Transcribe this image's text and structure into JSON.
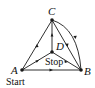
{
  "diagram": {
    "type": "directed-graph",
    "nodes": [
      {
        "id": "A",
        "label": "A",
        "x": 22,
        "y": 70
      },
      {
        "id": "B",
        "label": "B",
        "x": 81,
        "y": 70
      },
      {
        "id": "C",
        "label": "C",
        "x": 52,
        "y": 20
      },
      {
        "id": "D",
        "label": "D",
        "x": 52,
        "y": 52
      }
    ],
    "edges": [
      {
        "from": "A",
        "to": "C",
        "shape": "straight"
      },
      {
        "from": "D",
        "to": "C",
        "shape": "straight"
      },
      {
        "from": "C",
        "to": "B",
        "shape": "straight"
      },
      {
        "from": "C",
        "to": "B",
        "shape": "curved"
      },
      {
        "from": "A",
        "to": "D",
        "shape": "straight"
      },
      {
        "from": "D",
        "to": "B",
        "shape": "straight"
      },
      {
        "from": "A",
        "to": "B",
        "shape": "straight"
      }
    ],
    "annotations": {
      "start": "Start",
      "stop": "Stop"
    },
    "colors": {
      "line": "#1a1a1a",
      "background": "#ffffff"
    }
  }
}
